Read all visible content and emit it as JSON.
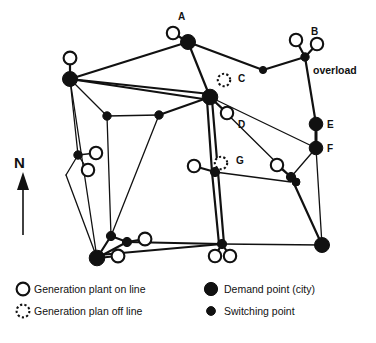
{
  "figure": {
    "type": "power-grid-network-diagram",
    "background_color": "#ffffff",
    "line_color": "#111111"
  },
  "compass": {
    "label": "N",
    "icon": "north-arrow-icon"
  },
  "annotations": [
    {
      "id": "overload",
      "text": "overload",
      "x": 313,
      "y": 74
    }
  ],
  "node_labels": [
    {
      "id": "A",
      "text": "A",
      "x": 178,
      "y": 20
    },
    {
      "id": "B",
      "text": "B",
      "x": 311,
      "y": 35
    },
    {
      "id": "C",
      "text": "C",
      "x": 238,
      "y": 82
    },
    {
      "id": "D",
      "text": "D",
      "x": 238,
      "y": 128
    },
    {
      "id": "E",
      "text": "E",
      "x": 327,
      "y": 128
    },
    {
      "id": "F",
      "text": "F",
      "x": 327,
      "y": 152
    },
    {
      "id": "G",
      "text": "G",
      "x": 236,
      "y": 164
    }
  ],
  "nodes": {
    "demand_points": [
      {
        "name": "demand-a",
        "x": 188,
        "y": 42,
        "r": 7.5
      },
      {
        "name": "demand-left-hub",
        "x": 70,
        "y": 79,
        "r": 7.5
      },
      {
        "name": "demand-center-hub",
        "x": 210,
        "y": 97,
        "r": 7.8
      },
      {
        "name": "demand-e",
        "x": 316,
        "y": 124,
        "r": 6.8
      },
      {
        "name": "demand-f",
        "x": 316,
        "y": 148,
        "r": 6.8
      },
      {
        "name": "demand-bottom-left",
        "x": 97,
        "y": 258,
        "r": 7.8
      },
      {
        "name": "demand-bottom-right",
        "x": 322,
        "y": 245,
        "r": 7.5
      }
    ],
    "switching_points": [
      {
        "name": "switch-top-right-mid",
        "x": 263,
        "y": 70,
        "r": 3.6
      },
      {
        "name": "switch-b-junction",
        "x": 305,
        "y": 57,
        "r": 4.2
      },
      {
        "name": "switch-left-upper",
        "x": 78,
        "y": 155,
        "r": 4.2
      },
      {
        "name": "switch-mid-left",
        "x": 107,
        "y": 116,
        "r": 4.2
      },
      {
        "name": "switch-mid-center",
        "x": 159,
        "y": 115,
        "r": 4.2
      },
      {
        "name": "switch-g-junction",
        "x": 215,
        "y": 172,
        "r": 4.6
      },
      {
        "name": "switch-right-mid",
        "x": 291,
        "y": 177,
        "r": 4.6
      },
      {
        "name": "switch-right-lower",
        "x": 296,
        "y": 182,
        "r": 4.0
      },
      {
        "name": "switch-bottom-center",
        "x": 222,
        "y": 244,
        "r": 4.6
      },
      {
        "name": "switch-bl-upper",
        "x": 111,
        "y": 236,
        "r": 4.6
      },
      {
        "name": "switch-bl-right",
        "x": 127,
        "y": 242,
        "r": 4.6
      }
    ],
    "plants_on_line": [
      {
        "name": "plant-a",
        "x": 173,
        "y": 33,
        "r": 6.2
      },
      {
        "name": "plant-b-left",
        "x": 296,
        "y": 40,
        "r": 6.2
      },
      {
        "name": "plant-b-right",
        "x": 317,
        "y": 44,
        "r": 6.2
      },
      {
        "name": "plant-left-hub-top",
        "x": 70,
        "y": 58,
        "r": 6.4
      },
      {
        "name": "plant-center-below",
        "x": 227,
        "y": 113,
        "r": 6.2
      },
      {
        "name": "plant-left-mid-upper",
        "x": 96,
        "y": 153,
        "r": 6.2
      },
      {
        "name": "plant-left-mid-lower",
        "x": 88,
        "y": 170,
        "r": 6.2
      },
      {
        "name": "plant-g-left",
        "x": 194,
        "y": 166,
        "r": 6.2
      },
      {
        "name": "plant-right-mid",
        "x": 277,
        "y": 165,
        "r": 6.2
      },
      {
        "name": "plant-bl-right",
        "x": 145,
        "y": 239,
        "r": 6.4
      },
      {
        "name": "plant-bl-below",
        "x": 118,
        "y": 256,
        "r": 6.4
      },
      {
        "name": "plant-bottom-left-of-pair",
        "x": 215,
        "y": 256,
        "r": 6.2
      },
      {
        "name": "plant-bottom-right-of-pair",
        "x": 230,
        "y": 256,
        "r": 6.2
      }
    ],
    "plants_off_line": [
      {
        "name": "plant-c-offline",
        "x": 224,
        "y": 80,
        "r": 6.2
      },
      {
        "name": "plant-g-offline",
        "x": 221,
        "y": 163,
        "r": 6.2
      }
    ]
  },
  "edges": [
    {
      "from": [
        188,
        42
      ],
      "to": [
        70,
        79
      ],
      "weight": "med"
    },
    {
      "from": [
        188,
        42
      ],
      "to": [
        173,
        33
      ],
      "weight": "med"
    },
    {
      "from": [
        188,
        42
      ],
      "to": [
        263,
        70
      ],
      "weight": "med"
    },
    {
      "from": [
        188,
        42
      ],
      "to": [
        210,
        97
      ],
      "weight": "med"
    },
    {
      "from": [
        263,
        70
      ],
      "to": [
        305,
        57
      ],
      "weight": "med"
    },
    {
      "from": [
        305,
        57
      ],
      "to": [
        296,
        40
      ],
      "weight": "med"
    },
    {
      "from": [
        305,
        57
      ],
      "to": [
        317,
        44
      ],
      "weight": "med"
    },
    {
      "from": [
        305,
        57
      ],
      "to": [
        316,
        124
      ],
      "weight": "med"
    },
    {
      "from": [
        70,
        79
      ],
      "to": [
        70,
        58
      ],
      "weight": "med"
    },
    {
      "from": [
        70,
        79
      ],
      "to": [
        210,
        94
      ],
      "weight": "med"
    },
    {
      "from": [
        70,
        79
      ],
      "to": [
        210,
        100
      ],
      "weight": "med"
    },
    {
      "from": [
        70,
        79
      ],
      "to": [
        107,
        116
      ],
      "weight": "thin"
    },
    {
      "from": [
        70,
        79
      ],
      "to": [
        78,
        155
      ],
      "weight": "thin"
    },
    {
      "from": [
        70,
        79
      ],
      "to": [
        97,
        258
      ],
      "weight": "thin"
    },
    {
      "from": [
        210,
        97
      ],
      "to": [
        227,
        113
      ],
      "weight": "med"
    },
    {
      "from": [
        210,
        97
      ],
      "to": [
        159,
        115
      ],
      "weight": "med"
    },
    {
      "from": [
        210,
        97
      ],
      "to": [
        291,
        177
      ],
      "weight": "thin"
    },
    {
      "from": [
        210,
        97
      ],
      "to": [
        316,
        148
      ],
      "weight": "thin"
    },
    {
      "from": [
        212,
        100
      ],
      "to": [
        218,
        172
      ],
      "weight": "med"
    },
    {
      "from": [
        207,
        100
      ],
      "to": [
        212,
        172
      ],
      "weight": "med"
    },
    {
      "from": [
        107,
        116
      ],
      "to": [
        159,
        115
      ],
      "weight": "thin"
    },
    {
      "from": [
        107,
        116
      ],
      "to": [
        111,
        236
      ],
      "weight": "thin"
    },
    {
      "from": [
        159,
        115
      ],
      "to": [
        111,
        236
      ],
      "weight": "thin"
    },
    {
      "from": [
        78,
        155
      ],
      "to": [
        96,
        153
      ],
      "weight": "thin"
    },
    {
      "from": [
        78,
        155
      ],
      "to": [
        88,
        170
      ],
      "weight": "thin"
    },
    {
      "from": [
        78,
        155
      ],
      "to": [
        66,
        175
      ],
      "weight": "thin"
    },
    {
      "from": [
        66,
        175
      ],
      "to": [
        97,
        258
      ],
      "weight": "thin"
    },
    {
      "from": [
        215,
        172
      ],
      "to": [
        194,
        166
      ],
      "weight": "med"
    },
    {
      "from": [
        215,
        172
      ],
      "to": [
        291,
        182
      ],
      "weight": "thin"
    },
    {
      "from": [
        218,
        172
      ],
      "to": [
        224,
        244
      ],
      "weight": "med"
    },
    {
      "from": [
        212,
        172
      ],
      "to": [
        219,
        244
      ],
      "weight": "med"
    },
    {
      "from": [
        291,
        177
      ],
      "to": [
        277,
        165
      ],
      "weight": "med"
    },
    {
      "from": [
        291,
        177
      ],
      "to": [
        316,
        148
      ],
      "weight": "thin"
    },
    {
      "from": [
        291,
        177
      ],
      "to": [
        322,
        245
      ],
      "weight": "med"
    },
    {
      "from": [
        316,
        124
      ],
      "to": [
        316,
        148
      ],
      "weight": "thick"
    },
    {
      "from": [
        316,
        148
      ],
      "to": [
        322,
        245
      ],
      "weight": "thin"
    },
    {
      "from": [
        222,
        244
      ],
      "to": [
        215,
        256
      ],
      "weight": "med"
    },
    {
      "from": [
        222,
        244
      ],
      "to": [
        230,
        256
      ],
      "weight": "med"
    },
    {
      "from": [
        222,
        244
      ],
      "to": [
        322,
        245
      ],
      "weight": "thin"
    },
    {
      "from": [
        222,
        244
      ],
      "to": [
        127,
        242
      ],
      "weight": "med"
    },
    {
      "from": [
        222,
        244
      ],
      "to": [
        99,
        255
      ],
      "weight": "med"
    },
    {
      "from": [
        127,
        242
      ],
      "to": [
        145,
        239
      ],
      "weight": "med"
    },
    {
      "from": [
        127,
        242
      ],
      "to": [
        97,
        258
      ],
      "weight": "med"
    },
    {
      "from": [
        111,
        236
      ],
      "to": [
        97,
        258
      ],
      "weight": "med"
    },
    {
      "from": [
        111,
        236
      ],
      "to": [
        127,
        242
      ],
      "weight": "med"
    },
    {
      "from": [
        97,
        258
      ],
      "to": [
        118,
        256
      ],
      "weight": "med"
    }
  ],
  "legend": {
    "items": [
      {
        "symbol": "plant-on-line-icon",
        "label": "Generation plant  on line"
      },
      {
        "symbol": "plant-off-line-icon",
        "label": "Generation plan off line"
      },
      {
        "symbol": "demand-point-icon",
        "label": "Demand point (city)"
      },
      {
        "symbol": "switching-point-icon",
        "label": "Switching point"
      }
    ]
  }
}
